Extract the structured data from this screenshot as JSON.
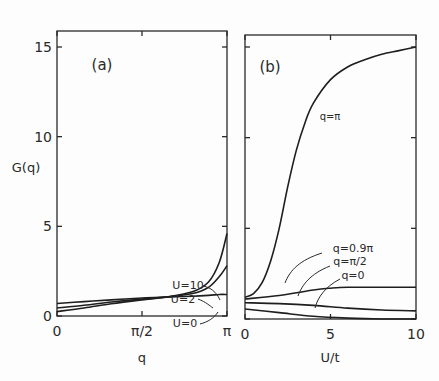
{
  "chart_data": [
    {
      "type": "line",
      "panel_label": "(a)",
      "xlabel": "q",
      "ylabel": "G(q)",
      "xlim": [
        0,
        3.1416
      ],
      "ylim": [
        0,
        16
      ],
      "xticks": [
        {
          "v": 0,
          "label": "0"
        },
        {
          "v": 1.5708,
          "label": "π/2"
        },
        {
          "v": 3.1416,
          "label": "π"
        }
      ],
      "yticks": [
        {
          "v": 0,
          "label": "0"
        },
        {
          "v": 5,
          "label": "5"
        },
        {
          "v": 10,
          "label": "10"
        },
        {
          "v": 15,
          "label": "15"
        }
      ],
      "grid": false,
      "series": [
        {
          "name": "U=0",
          "x": [
            0,
            0.5,
            1.0,
            1.5708,
            2.0,
            2.5,
            2.8,
            3.0,
            3.1416
          ],
          "y": [
            0.7,
            0.8,
            0.9,
            1.0,
            1.05,
            1.1,
            1.15,
            1.2,
            1.2
          ]
        },
        {
          "name": "U=2",
          "x": [
            0,
            0.5,
            1.0,
            1.5708,
            2.0,
            2.5,
            2.8,
            3.0,
            3.1416
          ],
          "y": [
            0.45,
            0.6,
            0.78,
            0.95,
            1.05,
            1.25,
            1.6,
            2.2,
            2.8
          ]
        },
        {
          "name": "U=10",
          "x": [
            0,
            0.5,
            1.0,
            1.5708,
            2.0,
            2.5,
            2.8,
            3.0,
            3.1416
          ],
          "y": [
            0.25,
            0.45,
            0.68,
            0.9,
            1.05,
            1.35,
            1.9,
            3.0,
            4.6
          ]
        }
      ],
      "annotations": [
        "U=10",
        "U=2",
        "U=0"
      ]
    },
    {
      "type": "line",
      "panel_label": "(b)",
      "xlabel": "U/t",
      "ylabel": "",
      "xlim": [
        0,
        10
      ],
      "ylim": [
        0,
        16
      ],
      "xticks": [
        {
          "v": 0,
          "label": "0"
        },
        {
          "v": 5,
          "label": "5"
        },
        {
          "v": 10,
          "label": "10"
        }
      ],
      "yticks": [
        {
          "v": 0,
          "label": ""
        },
        {
          "v": 5,
          "label": ""
        },
        {
          "v": 10,
          "label": ""
        },
        {
          "v": 15,
          "label": ""
        }
      ],
      "grid": false,
      "series": [
        {
          "name": "q=π",
          "x": [
            0,
            0.5,
            1.0,
            1.5,
            2.0,
            2.5,
            3.0,
            3.5,
            4.0,
            5.0,
            6.0,
            7.0,
            8.0,
            9.0,
            10.0
          ],
          "y": [
            1.2,
            1.4,
            2.0,
            3.2,
            5.0,
            7.3,
            9.3,
            10.8,
            11.9,
            13.2,
            13.9,
            14.3,
            14.6,
            14.8,
            15.0
          ]
        },
        {
          "name": "q=0.9π",
          "x": [
            0,
            2,
            4,
            5,
            6,
            8,
            10
          ],
          "y": [
            1.1,
            1.3,
            1.6,
            1.7,
            1.75,
            1.75,
            1.75
          ]
        },
        {
          "name": "q=π/2",
          "x": [
            0,
            2,
            4,
            6,
            8,
            10
          ],
          "y": [
            0.9,
            0.85,
            0.75,
            0.6,
            0.5,
            0.45
          ]
        },
        {
          "name": "q=0",
          "x": [
            0,
            2,
            4,
            6,
            8,
            10
          ],
          "y": [
            0.55,
            0.35,
            0.15,
            0.05,
            0.0,
            0.0
          ]
        }
      ],
      "annotations": [
        "q=π",
        "q=0.9π",
        "q=π/2",
        "q=0"
      ]
    }
  ]
}
